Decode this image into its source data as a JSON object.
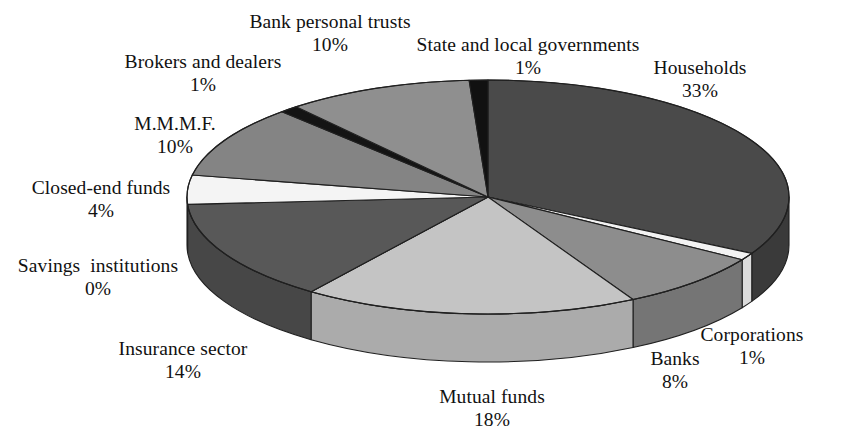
{
  "chart_data": {
    "type": "pie",
    "title": "",
    "subtitle": "",
    "xlabel": "",
    "ylabel": "",
    "legend_position": "none",
    "grid": false,
    "units": "%",
    "three_d": true,
    "start_angle_deg": 90,
    "direction": "clockwise",
    "categories": [
      "Households",
      "Corporations",
      "Banks",
      "Mutual funds",
      "Insurance sector",
      "Savings  institutions",
      "Closed-end funds",
      "M.M.M.F.",
      "Brokers and dealers",
      "Bank personal trusts",
      "State and local governments"
    ],
    "values": [
      33,
      1,
      8,
      18,
      14,
      0,
      4,
      10,
      1,
      10,
      1
    ],
    "slices": [
      {
        "name": "Households",
        "value": 33,
        "value_label": "33%",
        "color": "#4a4a4a",
        "side_color": "#3a3a3a",
        "label_x": 700,
        "label_y": 56
      },
      {
        "name": "Corporations",
        "value": 1,
        "value_label": "1%",
        "color": "#f2f2f2",
        "side_color": "#dcdcdc",
        "label_x": 752,
        "label_y": 323
      },
      {
        "name": "Banks",
        "value": 8,
        "value_label": "8%",
        "color": "#8d8d8d",
        "side_color": "#757575",
        "label_x": 675,
        "label_y": 347
      },
      {
        "name": "Mutual funds",
        "value": 18,
        "value_label": "18%",
        "color": "#c4c4c4",
        "side_color": "#ababab",
        "label_x": 492,
        "label_y": 385
      },
      {
        "name": "Savings  institutions",
        "value": 0,
        "value_label": "0%",
        "color": "#9a9a9a",
        "side_color": "#828282",
        "label_x": 98,
        "label_y": 254
      },
      {
        "name": "Insurance sector",
        "value": 14,
        "value_label": "14%",
        "color": "#585858",
        "side_color": "#474747",
        "label_x": 183,
        "label_y": 337
      },
      {
        "name": "Closed-end funds",
        "value": 4,
        "value_label": "4%",
        "color": "#f4f4f4",
        "side_color": "#dddddd",
        "label_x": 101,
        "label_y": 176
      },
      {
        "name": "M.M.M.F.",
        "value": 10,
        "value_label": "10%",
        "color": "#848484",
        "side_color": "#6e6e6e",
        "label_x": 175,
        "label_y": 112
      },
      {
        "name": "Brokers and dealers",
        "value": 1,
        "value_label": "1%",
        "color": "#141414",
        "side_color": "#0d0d0d",
        "label_x": 203,
        "label_y": 50
      },
      {
        "name": "Bank personal trusts",
        "value": 10,
        "value_label": "10%",
        "color": "#8f8f8f",
        "side_color": "#787878",
        "label_x": 330,
        "label_y": 10
      },
      {
        "name": "State and local governments",
        "value": 1,
        "value_label": "1%",
        "color": "#111111",
        "side_color": "#0a0a0a",
        "label_x": 528,
        "label_y": 33
      }
    ],
    "geometry": {
      "center_x": 488,
      "center_y": 197,
      "radius_x": 301,
      "radius_y": 117,
      "depth": 48
    },
    "colors": {
      "background": "#ffffff",
      "outline": "#202020",
      "text": "#111111"
    }
  }
}
